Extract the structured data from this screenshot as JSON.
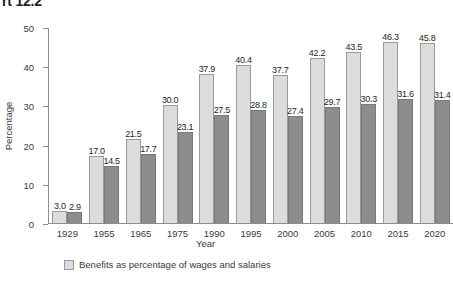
{
  "title": "rt 12.2",
  "legend": {
    "items": [
      {
        "label": "Benefits as percentage of wages and salaries",
        "color": "#dcdcdc"
      }
    ]
  },
  "chart_data": {
    "type": "bar",
    "title": "rt 12.2",
    "xlabel": "Year",
    "ylabel": "Percentage",
    "ylim": [
      0,
      50
    ],
    "yticks": [
      0,
      10,
      20,
      30,
      40,
      50
    ],
    "grid": false,
    "legend_position": "bottom-left",
    "categories": [
      "1929",
      "1955",
      "1965",
      "1975",
      "1990",
      "1995",
      "2000",
      "2005",
      "2010",
      "2015",
      "2020"
    ],
    "series": [
      {
        "name": "Benefits as percentage of wages and salaries",
        "color": "#dcdcdc",
        "values": [
          3.0,
          17.0,
          21.5,
          30.0,
          37.9,
          40.4,
          37.7,
          42.2,
          43.5,
          46.3,
          45.8
        ],
        "labels": [
          "3.0",
          "17.0",
          "21.5",
          "30.0",
          "37.9",
          "40.4",
          "37.7",
          "42.2",
          "43.5",
          "46.3",
          "45.8"
        ]
      },
      {
        "name": "series-2",
        "color": "#8d8d8d",
        "values": [
          2.9,
          14.5,
          17.7,
          23.1,
          27.5,
          28.8,
          27.4,
          29.7,
          30.3,
          31.6,
          31.4
        ],
        "labels": [
          "2.9",
          "14.5",
          "17.7",
          "23.1",
          "27.5",
          "28.8",
          "27.4",
          "29.7",
          "30.3",
          "31.6",
          "31.4"
        ]
      }
    ]
  }
}
